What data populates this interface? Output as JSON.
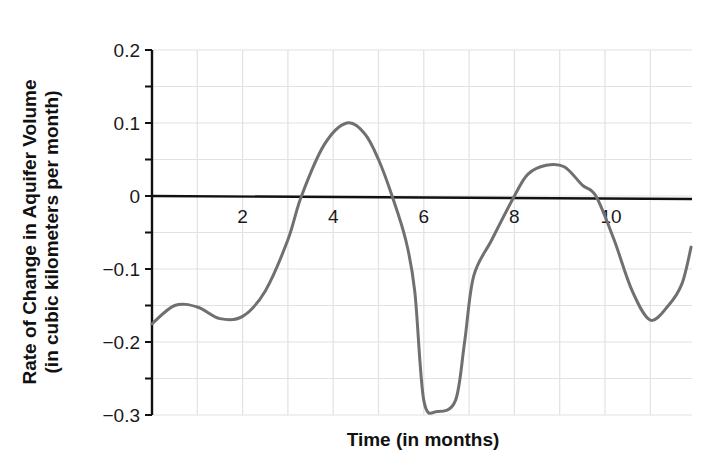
{
  "chart_data": {
    "type": "line",
    "title": "",
    "xlabel": "Time (in months)",
    "ylabel": "Rate of Change in Aquifer Volume",
    "ylabel_line2": "(in cubic kilometers per month)",
    "xlim": [
      0,
      11.9
    ],
    "ylim": [
      -0.3,
      0.2
    ],
    "grid": true,
    "legend": null,
    "x_ticks": [
      {
        "value": 2,
        "label": "2"
      },
      {
        "value": 4,
        "label": "4"
      },
      {
        "value": 6,
        "label": "6"
      },
      {
        "value": 8,
        "label": "8"
      },
      {
        "value": 10,
        "label": "10"
      }
    ],
    "y_ticks": [
      {
        "value": 0.2,
        "label": "0.2"
      },
      {
        "value": 0.1,
        "label": "0.1"
      },
      {
        "value": 0,
        "label": "0"
      },
      {
        "value": -0.1,
        "label": "−0.1"
      },
      {
        "value": -0.2,
        "label": "−0.2"
      },
      {
        "value": -0.3,
        "label": "−0.3"
      }
    ],
    "y_minor_step": 0.05,
    "x_grid_step": 1,
    "series": [
      {
        "name": "Rate of change",
        "color": "#707070",
        "x": [
          0,
          0.5,
          1.0,
          1.5,
          2.0,
          2.5,
          3.0,
          3.3,
          3.8,
          4.3,
          4.7,
          5.0,
          5.3,
          5.6,
          5.8,
          6.0,
          6.3,
          6.7,
          6.9,
          7.1,
          7.5,
          8.0,
          8.3,
          8.7,
          9.1,
          9.5,
          9.8,
          10.2,
          10.6,
          11.0,
          11.4,
          11.7,
          11.9
        ],
        "values": [
          -0.175,
          -0.15,
          -0.152,
          -0.168,
          -0.165,
          -0.13,
          -0.06,
          0.0,
          0.07,
          0.1,
          0.085,
          0.05,
          0.0,
          -0.06,
          -0.13,
          -0.28,
          -0.295,
          -0.28,
          -0.2,
          -0.11,
          -0.06,
          0.0,
          0.03,
          0.042,
          0.04,
          0.015,
          0.0,
          -0.06,
          -0.13,
          -0.17,
          -0.15,
          -0.12,
          -0.07
        ]
      }
    ]
  },
  "colors": {
    "curve": "#707070",
    "axis": "#111111",
    "grid": "#e2e2e2",
    "background": "#ffffff"
  }
}
